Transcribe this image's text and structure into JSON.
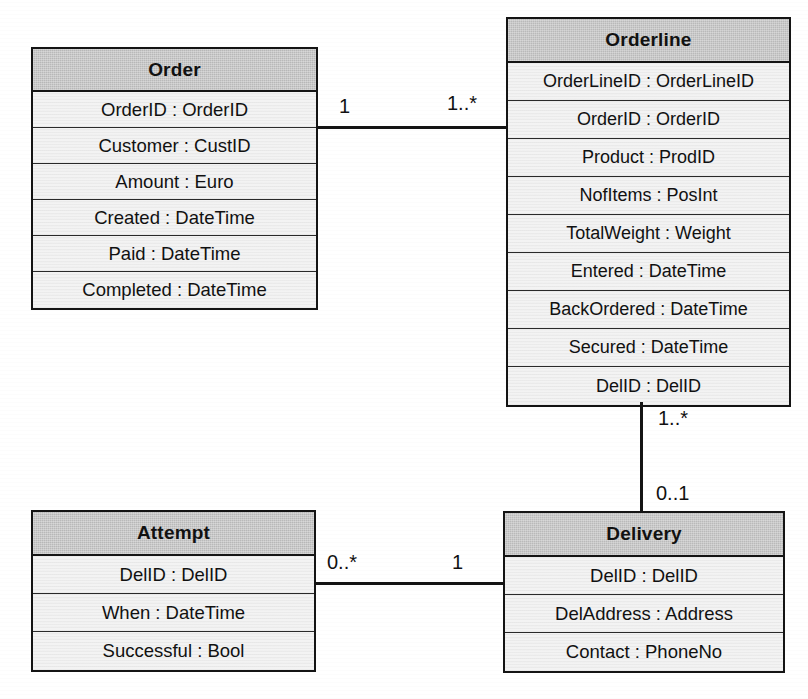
{
  "diagram": {
    "type": "uml-class-diagram",
    "classes": [
      {
        "id": "order",
        "name": "Order",
        "attributes": [
          "OrderID : OrderID",
          "Customer : CustID",
          "Amount : Euro",
          "Created : DateTime",
          "Paid : DateTime",
          "Completed : DateTime"
        ]
      },
      {
        "id": "orderline",
        "name": "Orderline",
        "attributes": [
          "OrderLineID : OrderLineID",
          "OrderID : OrderID",
          "Product : ProdID",
          "NofItems : PosInt",
          "TotalWeight : Weight",
          "Entered : DateTime",
          "BackOrdered : DateTime",
          "Secured : DateTime",
          "DelID : DelID"
        ]
      },
      {
        "id": "attempt",
        "name": "Attempt",
        "attributes": [
          "DelID : DelID",
          "When : DateTime",
          "Successful : Bool"
        ]
      },
      {
        "id": "delivery",
        "name": "Delivery",
        "attributes": [
          "DelID : DelID",
          "DelAddress : Address",
          "Contact : PhoneNo"
        ]
      }
    ],
    "associations": [
      {
        "id": "order-orderline",
        "from": "Order",
        "to": "Orderline",
        "from_multiplicity": "1",
        "to_multiplicity": "1..*",
        "orientation": "horizontal"
      },
      {
        "id": "orderline-delivery",
        "from": "Orderline",
        "to": "Delivery",
        "from_multiplicity": "1..*",
        "to_multiplicity": "0..1",
        "orientation": "vertical"
      },
      {
        "id": "attempt-delivery",
        "from": "Attempt",
        "to": "Delivery",
        "from_multiplicity": "0..*",
        "to_multiplicity": "1",
        "orientation": "horizontal"
      }
    ],
    "colors": {
      "header_fill": "#b9b9b9",
      "body_fill": "#f3f3f3",
      "line": "#141414",
      "background": "#ffffff"
    }
  }
}
